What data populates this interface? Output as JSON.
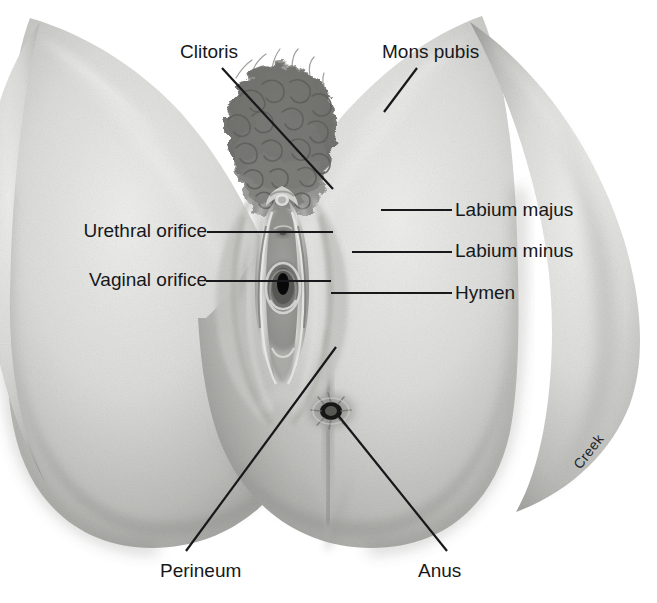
{
  "figure": {
    "type": "anatomical-illustration",
    "style": "grayscale pencil and airbrush medical illustration",
    "artist_signature": "Creek",
    "background_color": "#ffffff",
    "ink_color": "#16181a",
    "skin_light": "#e9e9e7",
    "skin_mid": "#c9c9c6",
    "skin_shadow": "#9a9a97",
    "hair_color": "#6f6f6d"
  },
  "labels": [
    {
      "id": "clitoris",
      "text": "Clitoris",
      "side": "top-left",
      "text_x": 180,
      "text_y": 42,
      "leader": {
        "x1": 222,
        "y1": 68,
        "x2": 333,
        "y2": 189
      }
    },
    {
      "id": "mons-pubis",
      "text": "Mons pubis",
      "side": "top-right",
      "text_x": 382,
      "text_y": 42,
      "leader": {
        "x1": 417,
        "y1": 68,
        "x2": 384,
        "y2": 112
      }
    },
    {
      "id": "labium-majus",
      "text": "Labium majus",
      "side": "right",
      "text_x": 455,
      "text_y": 200,
      "leader": {
        "x1": 452,
        "y1": 210,
        "x2": 381,
        "y2": 210
      }
    },
    {
      "id": "labium-minus",
      "text": "Labium minus",
      "side": "right",
      "text_x": 455,
      "text_y": 241,
      "leader": {
        "x1": 452,
        "y1": 252,
        "x2": 352,
        "y2": 252
      }
    },
    {
      "id": "hymen",
      "text": "Hymen",
      "side": "right",
      "text_x": 455,
      "text_y": 283,
      "leader": {
        "x1": 452,
        "y1": 293,
        "x2": 331,
        "y2": 293
      }
    },
    {
      "id": "urethral-orifice",
      "text": "Urethral orifice",
      "side": "left",
      "text_right_x": 207,
      "text_y": 221,
      "leader": {
        "x1": 207,
        "y1": 232,
        "x2": 333,
        "y2": 232
      }
    },
    {
      "id": "vaginal-orifice",
      "text": "Vaginal orifice",
      "side": "left",
      "text_right_x": 207,
      "text_y": 270,
      "leader": {
        "x1": 206,
        "y1": 281,
        "x2": 331,
        "y2": 281
      }
    },
    {
      "id": "perineum",
      "text": "Perineum",
      "side": "bottom-left",
      "text_x": 160,
      "text_y": 561,
      "leader": {
        "x1": 336,
        "y1": 347,
        "x2": 186,
        "y2": 551
      }
    },
    {
      "id": "anus",
      "text": "Anus",
      "side": "bottom-right",
      "text_x": 418,
      "text_y": 561,
      "leader": {
        "x1": 337,
        "y1": 414,
        "x2": 447,
        "y2": 551
      }
    }
  ],
  "structures": [
    {
      "id": "mons-pubis-region",
      "description": "Hair-covered mons pubis at top center"
    },
    {
      "id": "labium-majus-region",
      "description": "Outer fatty skin fold, left and right"
    },
    {
      "id": "labium-minus-region",
      "description": "Inner thin skin fold flanking the vestibule"
    },
    {
      "id": "clitoris-region",
      "description": "Clitoral glans under the prepuce at the anterior commissure"
    },
    {
      "id": "urethral-orifice-region",
      "description": "External urethral opening in the vestibule"
    },
    {
      "id": "vaginal-orifice-region",
      "description": "Vaginal opening in the vestibule"
    },
    {
      "id": "hymen-region",
      "description": "Membranous rim at the vaginal orifice"
    },
    {
      "id": "perineum-region",
      "description": "Skin between vaginal orifice and anus"
    },
    {
      "id": "anus-region",
      "description": "Anal opening with radiating folds"
    },
    {
      "id": "thigh-left",
      "description": "Left inner thigh and buttock"
    },
    {
      "id": "thigh-right",
      "description": "Right inner thigh and buttock"
    }
  ]
}
